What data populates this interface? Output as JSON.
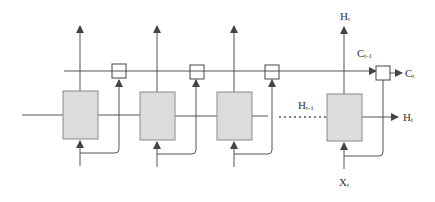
{
  "diagram": {
    "type": "unrolled-lstm-chain",
    "colors": {
      "line": "#555555",
      "cell_fill": "#dcdcdc",
      "cell_stroke": "#8a8a8a",
      "gate_fill": "#ffffff",
      "text": "#333333"
    },
    "labels": {
      "top_output": {
        "main": "H",
        "sub": "t"
      },
      "cell_state_prev": {
        "main": "C",
        "sub": "t-1"
      },
      "cell_state_out": {
        "main": "C",
        "sub": "t"
      },
      "hidden_prev": {
        "main": "H",
        "sub": "t-1"
      },
      "hidden_out": {
        "main": "H",
        "sub": "t"
      },
      "input": {
        "main": "X",
        "sub": "t"
      }
    },
    "cells": [
      {
        "id": "cell-1",
        "gate": "gate-1"
      },
      {
        "id": "cell-2",
        "gate": "gate-2"
      },
      {
        "id": "cell-3",
        "gate": "gate-3"
      },
      {
        "id": "cell-t",
        "gate": "gate-t"
      }
    ],
    "ellipsis": "dotted connection between cell-3 and cell-t"
  }
}
